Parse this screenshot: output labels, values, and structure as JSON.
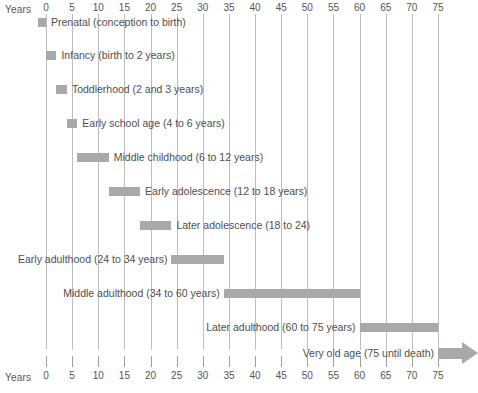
{
  "chart_data": {
    "type": "bar",
    "orientation": "horizontal",
    "title": "",
    "xlabel": "Years",
    "ylabel": "",
    "xlim": [
      -2,
      80
    ],
    "grid": true,
    "legend": "none",
    "axis_caption_left": "Years",
    "axis_caption_right": "Years",
    "tick_values": [
      0,
      5,
      10,
      15,
      20,
      25,
      30,
      35,
      40,
      45,
      50,
      55,
      60,
      65,
      70,
      75
    ],
    "tick_labels": [
      "0",
      "5",
      "10",
      "15",
      "20",
      "25",
      "30",
      "35",
      "40",
      "45",
      "50",
      "55",
      "60",
      "65",
      "70",
      "75"
    ],
    "bar_color": "#a9a9a9",
    "gridline_color": "#bdbdbd",
    "text_color": "#4e4e4e",
    "background_color": "#ffffff",
    "categories": [
      "Prenatal",
      "Infancy",
      "Toddlerhood",
      "Early school age",
      "Middle childhood",
      "Early adolescence",
      "Later adolescence",
      "Early adulthood",
      "Middle adulthood",
      "Later adulthood",
      "Very old age"
    ],
    "stages": [
      {
        "name": "Prenatal",
        "label": "Prenatal (conception to birth)",
        "start": -1.5,
        "end": 0,
        "label_side": "right",
        "open_ended": false
      },
      {
        "name": "Infancy",
        "label": "Infancy (birth to 2 years)",
        "start": 0,
        "end": 2,
        "label_side": "right",
        "open_ended": false
      },
      {
        "name": "Toddlerhood",
        "label": "Toddlerhood (2 and 3 years)",
        "start": 2,
        "end": 4,
        "label_side": "right",
        "open_ended": false
      },
      {
        "name": "Early school age",
        "label": "Early school age (4 to 6 years)",
        "start": 4,
        "end": 6,
        "label_side": "right",
        "open_ended": false
      },
      {
        "name": "Middle childhood",
        "label": "Middle childhood (6 to 12 years)",
        "start": 6,
        "end": 12,
        "label_side": "right",
        "open_ended": false
      },
      {
        "name": "Early adolescence",
        "label": "Early adolescence (12 to 18 years)",
        "start": 12,
        "end": 18,
        "label_side": "right",
        "open_ended": false
      },
      {
        "name": "Later adolescence",
        "label": "Later adolescence (18 to 24)",
        "start": 18,
        "end": 24,
        "label_side": "right",
        "open_ended": false
      },
      {
        "name": "Early adulthood",
        "label": "Early adulthood (24 to 34 years)",
        "start": 24,
        "end": 34,
        "label_side": "left",
        "open_ended": false
      },
      {
        "name": "Middle adulthood",
        "label": "Middle adulthood (34 to 60 years)",
        "start": 34,
        "end": 60,
        "label_side": "left",
        "open_ended": false
      },
      {
        "name": "Later adulthood",
        "label": "Later adulthood (60 to 75 years)",
        "start": 60,
        "end": 75,
        "label_side": "left",
        "open_ended": false
      },
      {
        "name": "Very old age",
        "label": "Very old age (75 until death)",
        "start": 75,
        "end": 82,
        "label_side": "left",
        "open_ended": true
      }
    ]
  }
}
